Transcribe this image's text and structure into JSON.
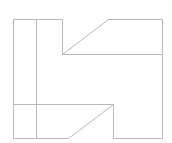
{
  "diagram": {
    "type": "line-drawing",
    "stroke_color": "#b8b8b8",
    "background_color": "#ffffff",
    "outline_points": [
      [
        13.5,
        19.5
      ],
      [
        62.5,
        19.5
      ],
      [
        62.5,
        54.5
      ],
      [
        108.5,
        19.5
      ],
      [
        162.5,
        19.5
      ],
      [
        162.5,
        138.5
      ],
      [
        113.5,
        138.5
      ],
      [
        113.5,
        104.5
      ],
      [
        68.5,
        138.5
      ],
      [
        13.5,
        138.5
      ]
    ],
    "inner_lines": [
      {
        "name": "vertical-divider",
        "x1": 36.5,
        "y1": 19.5,
        "x2": 36.5,
        "y2": 138.5
      },
      {
        "name": "upper-horizontal",
        "x1": 62.5,
        "y1": 54.5,
        "x2": 162.5,
        "y2": 54.5
      },
      {
        "name": "lower-horizontal",
        "x1": 13.5,
        "y1": 104.5,
        "x2": 113.5,
        "y2": 104.5
      }
    ]
  }
}
